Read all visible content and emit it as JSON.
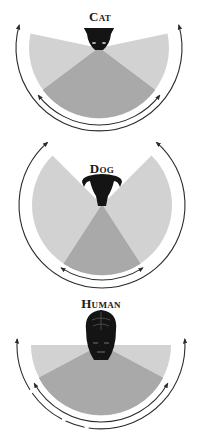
{
  "colors": {
    "background": "#ffffff",
    "peripheral_fill": "#d2d2d2",
    "binocular_fill": "#a9a9a9",
    "arrow": "#2b2b2b",
    "head": "#141414"
  },
  "panels": [
    {
      "id": "cat",
      "label": "Cat",
      "label_pos": [
        100,
        10
      ],
      "center": [
        99,
        48
      ],
      "radius": 70,
      "peripheral_arc": [
        -12,
        192
      ],
      "binocular_arc": [
        37,
        143
      ],
      "outer_arrow": {
        "radius": 83,
        "from": 196,
        "to": -16
      },
      "inner_arrow": {
        "radius": 77,
        "from": 142,
        "to": 38
      },
      "head": "cat"
    },
    {
      "id": "dog",
      "label": "Dog",
      "label_pos": [
        102,
        162
      ],
      "center": [
        102,
        205
      ],
      "radius": 70,
      "peripheral_arc": [
        -45,
        225
      ],
      "binocular_arc": [
        57,
        123
      ],
      "outer_arrow": {
        "radius": 83,
        "from": 229,
        "to": -49
      },
      "inner_arrow": {
        "radius": 75,
        "from": 123,
        "to": 57
      },
      "head": "dog"
    },
    {
      "id": "human",
      "label": "Human",
      "label_pos": [
        101,
        297
      ],
      "center": [
        101,
        345
      ],
      "radius": 70,
      "peripheral_arc": [
        0,
        180
      ],
      "binocular_arc": [
        28,
        152
      ],
      "outer_arrow": {
        "radius": 84,
        "from": 184,
        "to": -4
      },
      "inner_arrow": {
        "radius": 77,
        "from": 150,
        "to": 30
      },
      "head": "human"
    }
  ],
  "chart_data": {
    "type": "diagram",
    "series": [
      {
        "name": "Cat",
        "total_field_deg": 200,
        "binocular_field_deg": 106
      },
      {
        "name": "Dog",
        "total_field_deg": 270,
        "binocular_field_deg": 66
      },
      {
        "name": "Human",
        "total_field_deg": 180,
        "binocular_field_deg": 124
      }
    ]
  }
}
